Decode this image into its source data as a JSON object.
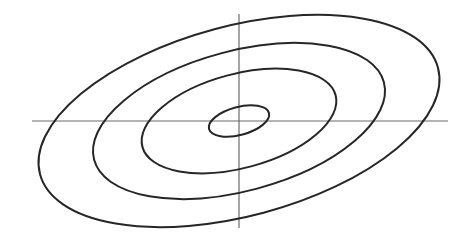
{
  "figure": {
    "background_color": "#ffffff",
    "width": 469,
    "height": 238
  },
  "axes": {
    "origin": {
      "x": 239,
      "y": 121
    },
    "color": "#6b6b6b",
    "stroke_width": 1.2,
    "horizontal": {
      "label": "horizontal-axis",
      "x1": 32,
      "y1": 121,
      "x2": 448,
      "y2": 121
    },
    "vertical": {
      "label": "vertical-axis",
      "x1": 239,
      "y1": 14,
      "x2": 239,
      "y2": 228
    }
  },
  "chart_data": {
    "type": "line",
    "subtitle": "",
    "xlabel": "",
    "ylabel": "",
    "xlim": [
      0,
      469
    ],
    "ylim": [
      0,
      238
    ],
    "grid": false,
    "legend": "none",
    "annotations": [],
    "tick_labels": {
      "x": [],
      "y": []
    },
    "center": {
      "x": 239,
      "y": 121
    },
    "rotation_deg": -15,
    "stroke_color": "#262626",
    "series": [
      {
        "name": "ellipse-1-innermost",
        "semi_major": 31,
        "semi_minor": 14,
        "stroke_width": 2.0
      },
      {
        "name": "ellipse-2",
        "semi_major": 100,
        "semi_minor": 47,
        "stroke_width": 2.0
      },
      {
        "name": "ellipse-3",
        "semi_major": 150,
        "semi_minor": 70,
        "stroke_width": 2.0
      },
      {
        "name": "ellipse-4-outermost",
        "semi_major": 206,
        "semi_minor": 95,
        "stroke_width": 2.0
      }
    ]
  }
}
